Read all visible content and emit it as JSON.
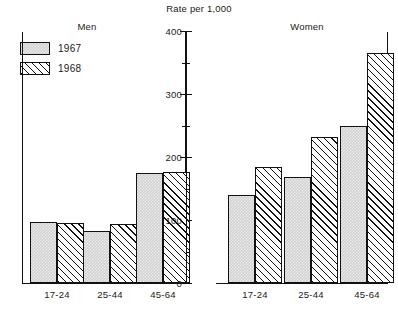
{
  "chart_data": {
    "type": "bar",
    "title": "Rate per 1,000",
    "xlabel": "",
    "ylabel": "",
    "ylim": [
      0,
      400
    ],
    "yticks": [
      0,
      100,
      200,
      300,
      400
    ],
    "ytick_labels": [
      "0",
      "100",
      "200",
      "300",
      "400"
    ],
    "minor_tick_step": 50,
    "grid": false,
    "legend_position": "top-left",
    "categories": [
      "17-24",
      "25-44",
      "45-64"
    ],
    "panels": [
      {
        "name": "Men",
        "series": [
          {
            "name": "1967",
            "values": [
              97,
              82,
              174
            ]
          },
          {
            "name": "1968",
            "values": [
              95,
              93,
              177
            ]
          }
        ]
      },
      {
        "name": "Women",
        "series": [
          {
            "name": "1967",
            "values": [
              139,
              169,
              250
            ]
          },
          {
            "name": "1968",
            "values": [
              184,
              232,
              365
            ]
          }
        ]
      }
    ],
    "series_styles": [
      {
        "name": "1967",
        "fill": "solid-gray",
        "color": "#d2d2d2"
      },
      {
        "name": "1968",
        "fill": "diagonal-hatch",
        "color": "#ffffff"
      }
    ]
  },
  "legend": {
    "items": [
      {
        "label": "1967",
        "swatch": "solid-gray-swatch"
      },
      {
        "label": "1968",
        "swatch": "hatched-swatch"
      }
    ]
  }
}
